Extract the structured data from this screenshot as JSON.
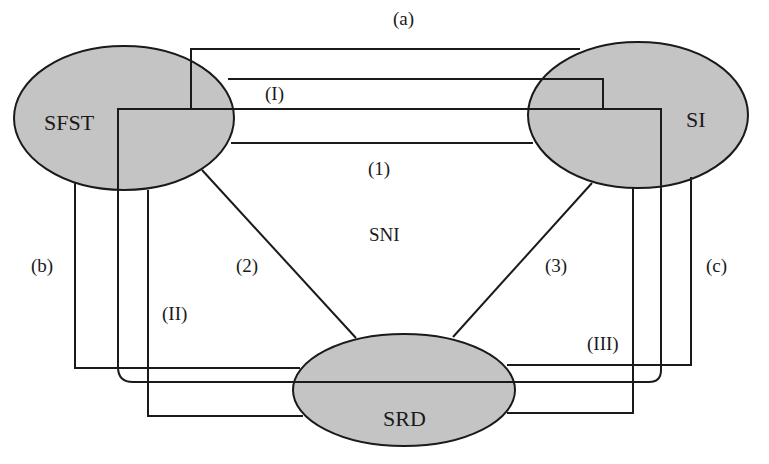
{
  "diagram": {
    "nodes": {
      "sfst": {
        "label": "SFST",
        "fill": "#c4c4c4"
      },
      "si": {
        "label": "SI",
        "fill": "#c4c4c4"
      },
      "srd": {
        "label": "SRD",
        "fill": "#c4c4c4"
      }
    },
    "center_label": "SNI",
    "direct_links": {
      "link1": "(1)",
      "link2": "(2)",
      "link3": "(3)"
    },
    "outer_links": {
      "a": "(a)",
      "b": "(b)",
      "c": "(c)"
    },
    "loop_links": {
      "I": "(I)",
      "II": "(II)",
      "III": "(III)"
    },
    "colors": {
      "line": "#1a1a1a",
      "node_fill": "#c4c4c4",
      "background": "#ffffff"
    }
  }
}
